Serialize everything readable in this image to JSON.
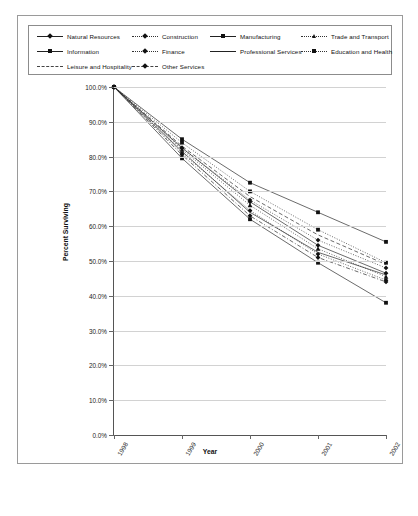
{
  "chart_data": {
    "type": "line",
    "title": "",
    "xlabel": "Year",
    "ylabel": "Percent Surviving",
    "categories": [
      "1998",
      "1999",
      "2000",
      "2001",
      "2002"
    ],
    "x": [
      1998,
      1999,
      2000,
      2001,
      2002
    ],
    "ylim": [
      0,
      100
    ],
    "ytick_labels": [
      "0.0%",
      "10.0%",
      "20.0%",
      "30.0%",
      "40.0%",
      "50.0%",
      "60.0%",
      "70.0%",
      "80.0%",
      "90.0%",
      "100.0%"
    ],
    "ytick_values": [
      0,
      10,
      20,
      30,
      40,
      50,
      60,
      70,
      80,
      90,
      100
    ],
    "grid": true,
    "legend_position": "top",
    "series": [
      {
        "name": "Natural Resources",
        "marker": "diamond",
        "line": "solid",
        "values": [
          100.0,
          82.5,
          67.0,
          54.5,
          46.5
        ]
      },
      {
        "name": "Construction",
        "marker": "diamond",
        "line": "dotted",
        "values": [
          100.0,
          81.0,
          64.5,
          52.0,
          44.5
        ]
      },
      {
        "name": "Manufacturing",
        "marker": "square",
        "line": "solid",
        "values": [
          100.0,
          85.0,
          72.5,
          64.0,
          55.5
        ]
      },
      {
        "name": "Trade and Transport",
        "marker": "triangle",
        "line": "dotted",
        "values": [
          100.0,
          82.0,
          66.0,
          53.5,
          45.5
        ]
      },
      {
        "name": "Information",
        "marker": "square",
        "line": "solid",
        "values": [
          100.0,
          79.5,
          62.0,
          49.5,
          38.0
        ]
      },
      {
        "name": "Finance",
        "marker": "diamond",
        "line": "dotted",
        "values": [
          100.0,
          82.5,
          67.5,
          56.0,
          48.0
        ]
      },
      {
        "name": "Professional Services",
        "marker": "none",
        "line": "solid",
        "values": [
          100.0,
          81.5,
          64.0,
          52.5,
          46.0
        ]
      },
      {
        "name": "Education and Health",
        "marker": "square",
        "line": "dotted",
        "values": [
          100.0,
          84.0,
          70.0,
          59.0,
          49.5
        ]
      },
      {
        "name": "Leisure and Hospitality",
        "marker": "none",
        "line": "dashed",
        "values": [
          100.0,
          83.0,
          68.5,
          57.5,
          49.0
        ]
      },
      {
        "name": "Other Services",
        "marker": "diamond",
        "line": "dashdot",
        "values": [
          100.0,
          80.5,
          63.0,
          51.0,
          44.0
        ]
      }
    ]
  },
  "legend": {
    "items": [
      {
        "label": "Natural Resources"
      },
      {
        "label": "Construction"
      },
      {
        "label": "Manufacturing"
      },
      {
        "label": "Trade and Transport"
      },
      {
        "label": "Information"
      },
      {
        "label": "Finance"
      },
      {
        "label": "Professional Services"
      },
      {
        "label": "Education and Health"
      },
      {
        "label": "Leisure and Hospitality"
      },
      {
        "label": "Other Services"
      }
    ]
  }
}
